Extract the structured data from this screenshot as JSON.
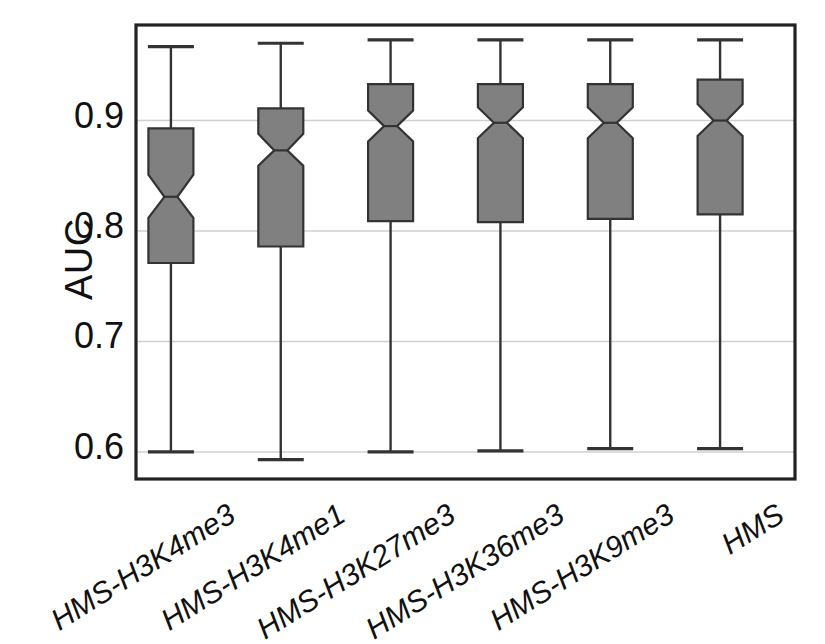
{
  "chart_data": {
    "type": "box",
    "title": "",
    "xlabel": "",
    "ylabel": "AUC",
    "ylim": [
      0.5755,
      0.9865
    ],
    "yticks": [
      0.6,
      0.7,
      0.8,
      0.9
    ],
    "ytick_labels": [
      "0.6",
      "0.7",
      "0.8",
      "0.9"
    ],
    "grid": "horizontal",
    "notched": true,
    "legend": "none",
    "categories": [
      "HMS-H3K4me3",
      "HMS-H3K4me1",
      "HMS-H3K27me3",
      "HMS-H3K36me3",
      "HMS-H3K9me3",
      "HMS"
    ],
    "boxes": [
      {
        "label": "HMS-H3K4me3",
        "whisker_low": 0.6,
        "q1": 0.771,
        "median": 0.831,
        "q3": 0.893,
        "whisker_high": 0.967,
        "notch_low": 0.812,
        "notch_high": 0.851
      },
      {
        "label": "HMS-H3K4me1",
        "whisker_low": 0.593,
        "q1": 0.786,
        "median": 0.873,
        "q3": 0.911,
        "whisker_high": 0.97,
        "notch_low": 0.859,
        "notch_high": 0.888
      },
      {
        "label": "HMS-H3K27me3",
        "whisker_low": 0.6,
        "q1": 0.809,
        "median": 0.895,
        "q3": 0.933,
        "whisker_high": 0.973,
        "notch_low": 0.881,
        "notch_high": 0.909
      },
      {
        "label": "HMS-H3K36me3",
        "whisker_low": 0.601,
        "q1": 0.808,
        "median": 0.898,
        "q3": 0.933,
        "whisker_high": 0.973,
        "notch_low": 0.884,
        "notch_high": 0.912
      },
      {
        "label": "HMS-H3K9me3",
        "whisker_low": 0.603,
        "q1": 0.811,
        "median": 0.898,
        "q3": 0.933,
        "whisker_high": 0.973,
        "notch_low": 0.884,
        "notch_high": 0.912
      },
      {
        "label": "HMS",
        "whisker_low": 0.603,
        "q1": 0.815,
        "median": 0.9,
        "q3": 0.937,
        "whisker_high": 0.973,
        "notch_low": 0.886,
        "notch_high": 0.915
      }
    ],
    "colors": {
      "box_fill": "#808080",
      "box_edge": "#333333",
      "whisker": "#333333",
      "grid": "#d0d0d0",
      "axis": "#222222",
      "text": "#111111",
      "background": "#ffffff"
    }
  }
}
